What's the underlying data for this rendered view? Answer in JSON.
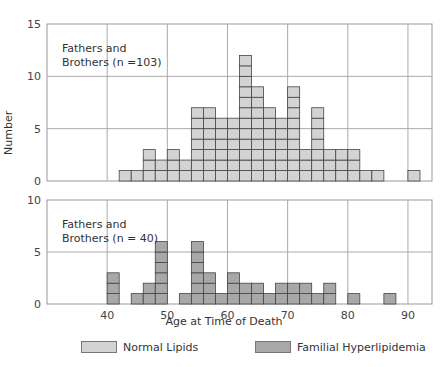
{
  "chart_data": [
    {
      "type": "bar",
      "subtype": "histogram",
      "panel": "top",
      "annotation": [
        "Fathers and",
        "Brothers (n =103)"
      ],
      "series": [
        {
          "name": "Normal Lipids",
          "color": "#d3d3d3"
        }
      ],
      "bin_width": 2,
      "bins": [
        {
          "start": 42,
          "count": 1
        },
        {
          "start": 44,
          "count": 1
        },
        {
          "start": 46,
          "count": 3
        },
        {
          "start": 48,
          "count": 2
        },
        {
          "start": 50,
          "count": 3
        },
        {
          "start": 52,
          "count": 2
        },
        {
          "start": 54,
          "count": 7
        },
        {
          "start": 56,
          "count": 7
        },
        {
          "start": 58,
          "count": 6
        },
        {
          "start": 60,
          "count": 6
        },
        {
          "start": 62,
          "count": 12
        },
        {
          "start": 64,
          "count": 9
        },
        {
          "start": 66,
          "count": 7
        },
        {
          "start": 68,
          "count": 6
        },
        {
          "start": 70,
          "count": 9
        },
        {
          "start": 72,
          "count": 3
        },
        {
          "start": 74,
          "count": 7
        },
        {
          "start": 76,
          "count": 3
        },
        {
          "start": 78,
          "count": 3
        },
        {
          "start": 80,
          "count": 3
        },
        {
          "start": 82,
          "count": 1
        },
        {
          "start": 84,
          "count": 1
        },
        {
          "start": 90,
          "count": 1
        }
      ],
      "ylabel": "Number",
      "ylim": [
        0,
        15
      ],
      "yticks": [
        0,
        5,
        10,
        15
      ],
      "xlim": [
        30,
        94
      ],
      "grid": true
    },
    {
      "type": "bar",
      "subtype": "histogram",
      "panel": "bottom",
      "annotation": [
        "Fathers and",
        "Brothers (n = 40)"
      ],
      "series": [
        {
          "name": "Familial Hyperlipidemia",
          "color": "#a8a8a8"
        }
      ],
      "bin_width": 2,
      "bins": [
        {
          "start": 40,
          "count": 3
        },
        {
          "start": 44,
          "count": 1
        },
        {
          "start": 46,
          "count": 2
        },
        {
          "start": 48,
          "count": 6
        },
        {
          "start": 52,
          "count": 1
        },
        {
          "start": 54,
          "count": 6
        },
        {
          "start": 56,
          "count": 3
        },
        {
          "start": 58,
          "count": 1
        },
        {
          "start": 60,
          "count": 3
        },
        {
          "start": 62,
          "count": 2
        },
        {
          "start": 64,
          "count": 2
        },
        {
          "start": 66,
          "count": 1
        },
        {
          "start": 68,
          "count": 2
        },
        {
          "start": 70,
          "count": 2
        },
        {
          "start": 72,
          "count": 2
        },
        {
          "start": 74,
          "count": 1
        },
        {
          "start": 76,
          "count": 2
        },
        {
          "start": 80,
          "count": 1
        },
        {
          "start": 86,
          "count": 1
        }
      ],
      "xlabel": "Age at Time of Death",
      "xticks": [
        40,
        50,
        60,
        70,
        80,
        90
      ],
      "ylim": [
        0,
        10
      ],
      "yticks": [
        0,
        5,
        10
      ],
      "xlim": [
        30,
        94
      ],
      "grid": true
    }
  ],
  "axis": {
    "ylabel": "Number",
    "xlabel": "Age at Time of Death"
  },
  "legend": [
    {
      "label": "Normal Lipids",
      "color": "#d3d3d3"
    },
    {
      "label": "Familial Hyperlipidemia",
      "color": "#a8a8a8"
    }
  ],
  "colors": {
    "grid": "#aaaaaa",
    "frame": "#999999",
    "cell_border": "#444444"
  }
}
